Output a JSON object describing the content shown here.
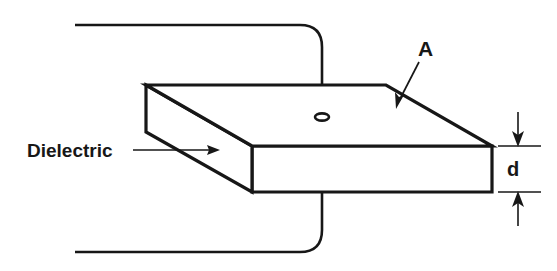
{
  "figure": {
    "background_color": "#ffffff",
    "ink_color": "#171717",
    "labels": {
      "dielectric": "Dielectric",
      "area": "A",
      "thickness": "d"
    },
    "annotations": [
      {
        "name": "dielectric-callout",
        "text": "Dielectric",
        "leader_from": [
          133,
          150
        ],
        "leader_to": [
          218,
          150
        ],
        "arrow": "right"
      },
      {
        "name": "area-callout",
        "text": "A",
        "leader_from": [
          419,
          62
        ],
        "leader_to": [
          398,
          104
        ],
        "arrow": "down-left"
      },
      {
        "name": "thickness-dimension",
        "text": "d",
        "extent_top_y": 146,
        "extent_bottom_y": 192,
        "axis_x": 518,
        "arrow": "both-inward"
      }
    ],
    "geometry": {
      "slab_top_back_left": [
        146,
        85
      ],
      "slab_top_back_right": [
        386,
        85
      ],
      "slab_top_front_right": [
        492,
        146
      ],
      "slab_top_front_left": [
        252,
        146
      ],
      "slab_bottom_front_left": [
        252,
        192
      ],
      "slab_bottom_front_right": [
        492,
        192
      ],
      "slab_left_bottom": [
        146,
        132
      ],
      "top_wire_y": 25,
      "top_wire_left_x": 75,
      "bottom_wire_y": 252,
      "bottom_wire_left_x": 75,
      "lead_x": 322,
      "terminal_center": [
        322,
        117
      ],
      "terminal_rx": 7,
      "terminal_ry": 3.6
    }
  }
}
